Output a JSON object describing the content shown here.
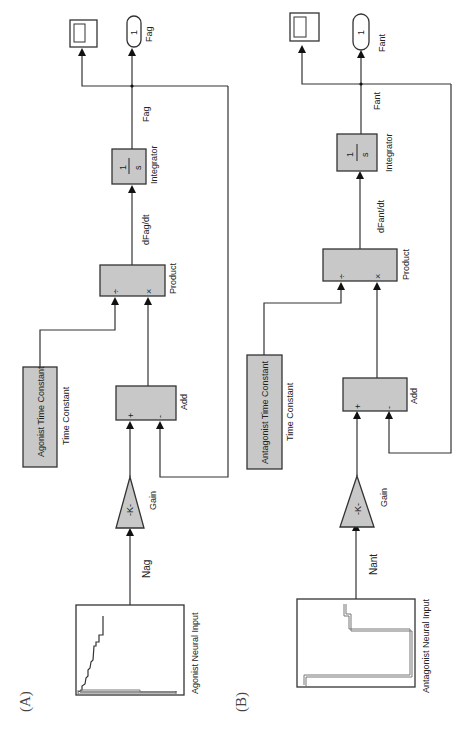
{
  "diagram": {
    "type": "simulink_block_diagram",
    "orientation": "rotated_90_ccw",
    "panels": [
      {
        "id": "A",
        "label": "(A)",
        "source": {
          "name": "Agonist Neural Input"
        },
        "signal_in": "Nag",
        "gain": {
          "name": "Gain",
          "value": "-K-"
        },
        "time_constant": {
          "text": "Agonist Time Constant",
          "name": "Time Constant"
        },
        "add": {
          "name": "Add",
          "ports": [
            "+",
            "-"
          ]
        },
        "product": {
          "name": "Product",
          "ports": [
            "÷",
            "×"
          ]
        },
        "derivative_signal": "dFag/dt",
        "integrator": {
          "name": "Integrator",
          "num": "1",
          "den": "s"
        },
        "output_signal": "Fag",
        "outport": {
          "number": "1",
          "name": "Fag"
        },
        "scope": {
          "name": "Scope"
        }
      },
      {
        "id": "B",
        "label": "(B)",
        "source": {
          "name": "Antagonist Neural Input"
        },
        "signal_in": "Nant",
        "gain": {
          "name": "Gain",
          "value": "-K-"
        },
        "time_constant": {
          "text": "Antagonist Time Constant",
          "name": "Time Constant"
        },
        "add": {
          "name": "Add",
          "ports": [
            "+",
            "-"
          ]
        },
        "product": {
          "name": "Product",
          "ports": [
            "÷",
            "×"
          ]
        },
        "derivative_signal": "dFant/dt",
        "integrator": {
          "name": "Integrator",
          "num": "1",
          "den": "s"
        },
        "output_signal": "Fant",
        "outport": {
          "number": "1",
          "name": "Fant"
        },
        "scope": {
          "name": "Scope"
        }
      }
    ]
  },
  "colors": {
    "block_fill": "#c8c8c8",
    "stroke": "#333333",
    "background": "#ffffff"
  }
}
